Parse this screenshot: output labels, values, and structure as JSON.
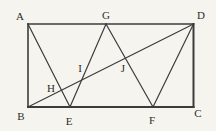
{
  "figure": {
    "colors": {
      "background": "#f5f4ef",
      "line": "#3c3c3c",
      "label": "#2e2d2a"
    },
    "canvas": {
      "width": 216,
      "height": 131
    },
    "points": [
      {
        "name": "A",
        "x": 28,
        "y": 24,
        "lx": 20,
        "ly": 20,
        "anchor": "middle"
      },
      {
        "name": "G",
        "x": 106,
        "y": 24,
        "lx": 106,
        "ly": 19,
        "anchor": "middle"
      },
      {
        "name": "D",
        "x": 193.5,
        "y": 24,
        "lx": 201,
        "ly": 19,
        "anchor": "middle"
      },
      {
        "name": "B",
        "x": 28,
        "y": 107,
        "lx": 21,
        "ly": 120,
        "anchor": "middle"
      },
      {
        "name": "E",
        "x": 70,
        "y": 107,
        "lx": 69,
        "ly": 125,
        "anchor": "middle"
      },
      {
        "name": "F",
        "x": 153,
        "y": 107,
        "lx": 152,
        "ly": 124,
        "anchor": "middle"
      },
      {
        "name": "C",
        "x": 193.5,
        "y": 107,
        "lx": 198,
        "ly": 117,
        "anchor": "middle"
      },
      {
        "name": "H",
        "x": 61.5,
        "y": 90,
        "lx": 51,
        "ly": 92,
        "anchor": "middle"
      },
      {
        "name": "I",
        "x": 82,
        "y": 80,
        "lx": 80,
        "ly": 72,
        "anchor": "middle"
      },
      {
        "name": "J",
        "x": 125.5,
        "y": 58,
        "lx": 123,
        "ly": 72,
        "anchor": "middle"
      }
    ],
    "segments": [
      {
        "from": "A",
        "to": "D",
        "width": 1.6
      },
      {
        "from": "D",
        "to": "C",
        "width": 2.0
      },
      {
        "from": "B",
        "to": "C",
        "width": 2.0
      },
      {
        "from": "A",
        "to": "B",
        "width": 1.6
      },
      {
        "from": "A",
        "to": "E",
        "width": 1.2
      },
      {
        "from": "G",
        "to": "E",
        "width": 1.2
      },
      {
        "from": "G",
        "to": "F",
        "width": 1.2
      },
      {
        "from": "D",
        "to": "F",
        "width": 1.2
      },
      {
        "from": "B",
        "to": "D",
        "width": 1.2
      }
    ]
  }
}
